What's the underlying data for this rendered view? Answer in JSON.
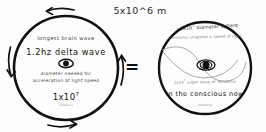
{
  "header": {
    "scale_label": "5x10^6 m"
  },
  "operator": {
    "equals": "="
  },
  "left_circle": {
    "name": "brain-wave-circle",
    "label_top": "longest brain wave",
    "label_main": "1.2hz delta wave",
    "label_sub_line1": "diameter needed for",
    "label_sub_line2": "acceleration at light speed",
    "value_mantissa": "1x10",
    "value_exponent": "7",
    "value_unit": "(meters)",
    "center_icon": "eye-icon",
    "rotation_arrows": [
      {
        "name": "arrow-top",
        "direction": "left"
      },
      {
        "name": "arrow-left",
        "direction": "down"
      },
      {
        "name": "arrow-bottom",
        "direction": "right"
      },
      {
        "name": "arrow-right",
        "direction": "up"
      }
    ]
  },
  "right_circle": {
    "name": "conscious-sphere-circle",
    "label_arc_top": "~1x10",
    "label_arc_top_exp": "7",
    "label_arc_top_rest": " diameter sphere",
    "label_arc_second": "conscious snapshot x speed of light",
    "label_arc_lower": "1x10",
    "label_arc_lower_exp": "7",
    "label_arc_lower_rest": " super wave of influence",
    "label_main": "in the conscious now",
    "label_unit": "(meters)",
    "center_icon": "eye-icon",
    "orbit_icon": "orbit-curve"
  },
  "colors": {
    "ink": "#111111",
    "faint_ink": "#8a8a8a",
    "background": "#ffffff"
  }
}
